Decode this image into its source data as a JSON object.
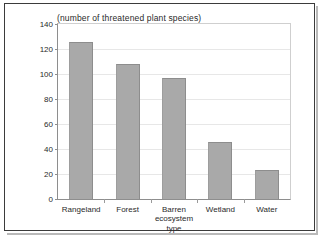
{
  "chart_data": {
    "type": "bar",
    "title": "(number of threatened plant species)",
    "xlabel_line1": "ecosystem",
    "xlabel_line2": "type",
    "ylabel": "",
    "categories": [
      "Rangeland",
      "Forest",
      "Barren",
      "Wetland",
      "Water"
    ],
    "values": [
      126,
      108,
      97,
      46,
      23
    ],
    "ylim": [
      0,
      140
    ],
    "yticks": [
      0,
      20,
      40,
      60,
      80,
      100,
      120,
      140
    ],
    "ytick_labels": [
      "0",
      "20",
      "40",
      "60",
      "80",
      "100",
      "120",
      "140"
    ],
    "grid": true,
    "legend": "none",
    "bar_color": "#a9a9a9",
    "axis_color": "#8e8e8e",
    "grid_color": "#e7e7e7",
    "text_color": "#2a2a2a",
    "background": "#ffffff"
  }
}
